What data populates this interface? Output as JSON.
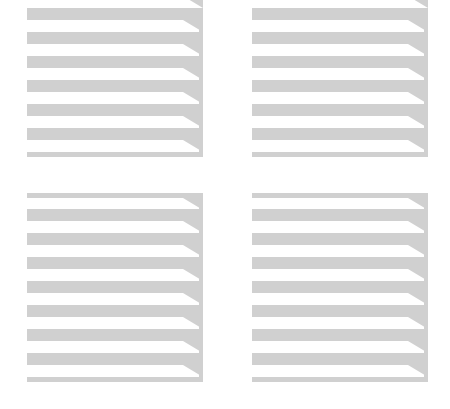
{
  "graphic": {
    "background": "#ffffff",
    "stripe_color": "#d0d0d0",
    "wedge_run": 20,
    "wedge_drop": 12,
    "blocks": [
      {
        "name": "block-top-left",
        "x": 27,
        "width": 176,
        "top_wedge_from": -4,
        "stripes": [
          {
            "y": 8,
            "h": 12
          },
          {
            "y": 32,
            "h": 12
          },
          {
            "y": 56,
            "h": 12
          },
          {
            "y": 80,
            "h": 12
          },
          {
            "y": 104,
            "h": 12
          },
          {
            "y": 128,
            "h": 12
          },
          {
            "y": 152,
            "h": 5,
            "no_wedge": true
          }
        ]
      },
      {
        "name": "block-top-right",
        "x": 252,
        "width": 176,
        "top_wedge_from": -4,
        "stripes": [
          {
            "y": 8,
            "h": 12
          },
          {
            "y": 32,
            "h": 12
          },
          {
            "y": 56,
            "h": 12
          },
          {
            "y": 80,
            "h": 12
          },
          {
            "y": 104,
            "h": 12
          },
          {
            "y": 128,
            "h": 12
          },
          {
            "y": 152,
            "h": 5,
            "no_wedge": true
          }
        ]
      },
      {
        "name": "block-bottom-left",
        "x": 27,
        "width": 176,
        "stripes": [
          {
            "y": 193,
            "h": 5
          },
          {
            "y": 209,
            "h": 12
          },
          {
            "y": 233,
            "h": 12
          },
          {
            "y": 257,
            "h": 12
          },
          {
            "y": 281,
            "h": 12
          },
          {
            "y": 305,
            "h": 12
          },
          {
            "y": 329,
            "h": 12
          },
          {
            "y": 353,
            "h": 12
          },
          {
            "y": 377,
            "h": 5,
            "no_wedge": true
          }
        ]
      },
      {
        "name": "block-bottom-right",
        "x": 252,
        "width": 176,
        "stripes": [
          {
            "y": 193,
            "h": 5
          },
          {
            "y": 209,
            "h": 12
          },
          {
            "y": 233,
            "h": 12
          },
          {
            "y": 257,
            "h": 12
          },
          {
            "y": 281,
            "h": 12
          },
          {
            "y": 305,
            "h": 12
          },
          {
            "y": 329,
            "h": 12
          },
          {
            "y": 353,
            "h": 12
          },
          {
            "y": 377,
            "h": 5,
            "no_wedge": true
          }
        ]
      }
    ]
  }
}
